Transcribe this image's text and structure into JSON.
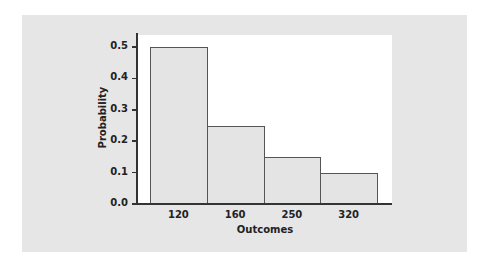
{
  "chart_data": {
    "type": "bar",
    "title": "",
    "xlabel": "Outcomes",
    "ylabel": "Probability",
    "categories": [
      "120",
      "160",
      "250",
      "320"
    ],
    "values": [
      0.5,
      0.25,
      0.15,
      0.1
    ],
    "ylim": [
      0,
      0.5
    ],
    "yticks": [
      "0.0",
      "0.1",
      "0.2",
      "0.3",
      "0.4",
      "0.5"
    ],
    "grid": false,
    "legend": null
  },
  "colors": {
    "card_bg": "#e6e6e6",
    "plot_bg": "#ffffff",
    "bar_fill": "#e4e4e4",
    "bar_edge": "#555555",
    "axis": "#333333"
  }
}
